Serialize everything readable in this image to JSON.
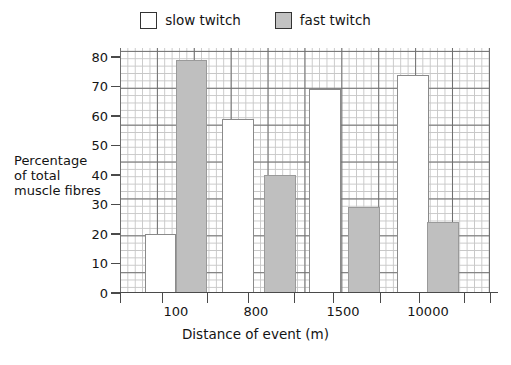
{
  "chart_data": {
    "type": "bar",
    "title": "",
    "xlabel": "Distance of event (m)",
    "ylabel": "Percentage\nof total\nmuscle fibres",
    "ylabel_lines": [
      "Percentage",
      "of total",
      "muscle fibres"
    ],
    "categories": [
      "100",
      "800",
      "1500",
      "10000"
    ],
    "series": [
      {
        "name": "slow twitch",
        "color": "#ffffff",
        "values": [
          20,
          59,
          69,
          74
        ]
      },
      {
        "name": "fast twitch",
        "color": "#bfbfbf",
        "values": [
          79,
          40,
          29,
          24
        ]
      }
    ],
    "ylim": [
      0,
      80
    ],
    "yticks": [
      0,
      10,
      20,
      30,
      40,
      50,
      60,
      70,
      80
    ],
    "ytick_labels": [
      "0",
      "10",
      "20",
      "30",
      "40",
      "50",
      "60",
      "70",
      "80"
    ],
    "grid": true,
    "grid_style": "graph-paper minor squares with bold major every 10 units",
    "legend_position": "top-center"
  },
  "legend": {
    "entries": [
      {
        "label": "slow twitch",
        "swatch": "white-square-swatch"
      },
      {
        "label": "fast twitch",
        "swatch": "gray-square-swatch"
      }
    ]
  },
  "axes": {
    "x_title": "Distance of event (m)",
    "y_title_lines": [
      "Percentage",
      "of total",
      "muscle fibres"
    ],
    "x_categories": [
      "100",
      "800",
      "1500",
      "10000"
    ],
    "y_ticks": [
      "80",
      "70",
      "60",
      "50",
      "40",
      "30",
      "20",
      "10",
      "0"
    ]
  },
  "colors": {
    "slow_twitch": "#ffffff",
    "fast_twitch": "#bfbfbf",
    "grid_major": "#6f6f6f",
    "grid_minor": "#c7c7c7",
    "axis": "#4a4a4a",
    "text": "#141414"
  }
}
